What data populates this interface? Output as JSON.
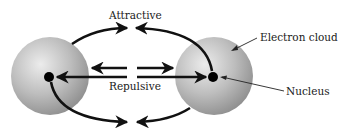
{
  "diagram": {
    "type": "interatomic-forces",
    "labels": {
      "attractive": "Attractive",
      "repulsive": "Repulsive",
      "electron_cloud": "Electron cloud",
      "nucleus": "Nucleus"
    },
    "atoms": [
      {
        "name": "left-atom",
        "cx": 50,
        "cy": 76,
        "r": 39,
        "nucleus_r": 5
      },
      {
        "name": "right-atom",
        "cx": 214,
        "cy": 76,
        "r": 39,
        "nucleus_r": 5
      }
    ],
    "colors": {
      "sphere_light": "#e8e8e8",
      "sphere_mid": "#b8b8b8",
      "sphere_dark": "#8a8a8a",
      "nucleus": "#000000",
      "arrow": "#111111",
      "text": "#1a1a1a"
    }
  }
}
